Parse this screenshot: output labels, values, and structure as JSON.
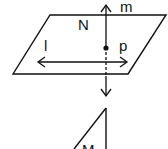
{
  "diagram": {
    "type": "geometry",
    "planes": [
      {
        "name": "N",
        "label": "N",
        "shape": "parallelogram"
      },
      {
        "name": "M",
        "label": "M",
        "shape": "partial-plane"
      }
    ],
    "lines": [
      {
        "name": "m",
        "label": "m",
        "orientation": "vertical",
        "arrows": "both"
      },
      {
        "name": "l",
        "label": "l",
        "orientation": "horizontal",
        "arrows": "both"
      }
    ],
    "points": [
      {
        "name": "p",
        "label": "p"
      }
    ],
    "colors": {
      "stroke": "#111111",
      "background": "#ffffff"
    }
  }
}
